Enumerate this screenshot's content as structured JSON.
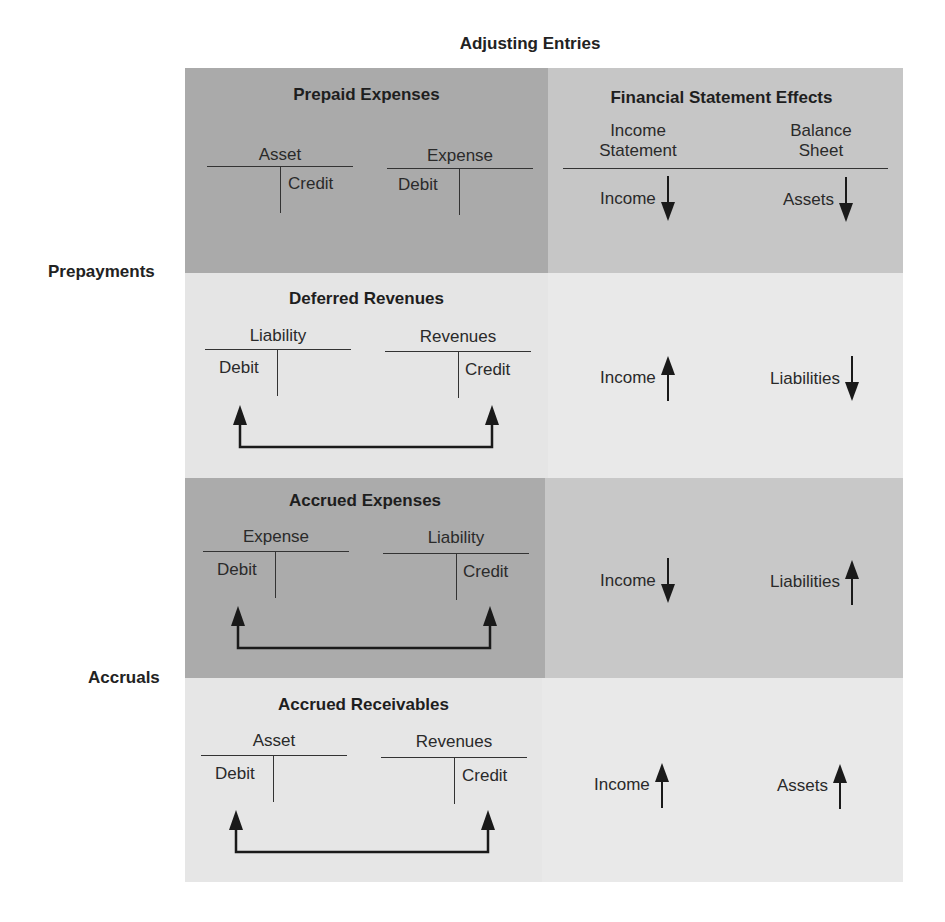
{
  "title": "Adjusting Entries",
  "groups": {
    "prepayments": "Prepayments",
    "accruals": "Accruals"
  },
  "colors": {
    "dark_left": "#aaaaaa",
    "dark_right": "#c6c6c6",
    "light_left": "#e5e5e5",
    "light_right": "#e9e9e9",
    "ink": "#1f1f1f"
  },
  "effects_header": {
    "title": "Financial Statement Effects",
    "col1_line1": "Income",
    "col1_line2": "Statement",
    "col2_line1": "Balance",
    "col2_line2": "Sheet"
  },
  "rows": [
    {
      "title": "Prepaid Expenses",
      "left_account": {
        "name": "Asset",
        "side_label": "Credit",
        "side": "right"
      },
      "right_account": {
        "name": "Expense",
        "side_label": "Debit",
        "side": "left"
      },
      "has_connector": false,
      "income_effect": {
        "label": "Income",
        "direction": "down"
      },
      "balance_effect": {
        "label": "Assets",
        "direction": "down"
      }
    },
    {
      "title": "Deferred Revenues",
      "left_account": {
        "name": "Liability",
        "side_label": "Debit",
        "side": "left"
      },
      "right_account": {
        "name": "Revenues",
        "side_label": "Credit",
        "side": "right"
      },
      "has_connector": true,
      "income_effect": {
        "label": "Income",
        "direction": "up"
      },
      "balance_effect": {
        "label": "Liabilities",
        "direction": "down"
      }
    },
    {
      "title": "Accrued Expenses",
      "left_account": {
        "name": "Expense",
        "side_label": "Debit",
        "side": "left"
      },
      "right_account": {
        "name": "Liability",
        "side_label": "Credit",
        "side": "right"
      },
      "has_connector": true,
      "income_effect": {
        "label": "Income",
        "direction": "down"
      },
      "balance_effect": {
        "label": "Liabilities",
        "direction": "up"
      }
    },
    {
      "title": "Accrued Receivables",
      "left_account": {
        "name": "Asset",
        "side_label": "Debit",
        "side": "left"
      },
      "right_account": {
        "name": "Revenues",
        "side_label": "Credit",
        "side": "right"
      },
      "has_connector": true,
      "income_effect": {
        "label": "Income",
        "direction": "up"
      },
      "balance_effect": {
        "label": "Assets",
        "direction": "up"
      }
    }
  ]
}
